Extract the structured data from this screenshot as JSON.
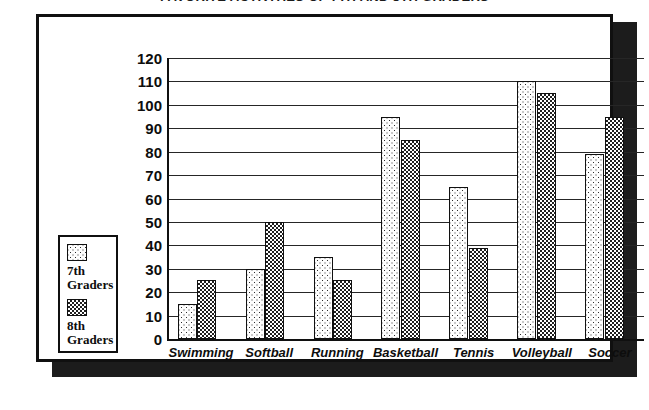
{
  "chart_data": {
    "type": "bar",
    "title": "FAVORITE ACTIVITIES OF 7TH AND 8TH GRADERS",
    "xlabel": "",
    "ylabel": "",
    "ylim": [
      0,
      120
    ],
    "ytick_step": 10,
    "yticks": [
      "120",
      "110",
      "100",
      "90",
      "80",
      "70",
      "60",
      "50",
      "40",
      "30",
      "20",
      "10",
      "0"
    ],
    "grid": true,
    "legend_position": "left-outside",
    "categories": [
      "Swimming",
      "Softball",
      "Running",
      "Basketball",
      "Tennis",
      "Volleyball",
      "Soccer"
    ],
    "series": [
      {
        "name": "7th Graders",
        "legend_label_line1": "7th",
        "legend_label_line2": "Graders",
        "pattern": "sparse-dots",
        "values": [
          15,
          30,
          35,
          95,
          65,
          110,
          79
        ]
      },
      {
        "name": "8th Graders",
        "legend_label_line1": "8th",
        "legend_label_line2": "Graders",
        "pattern": "dense-checker",
        "values": [
          25,
          50,
          25,
          85,
          39,
          105,
          95
        ]
      }
    ]
  },
  "colors": {
    "frame": "#101010",
    "shadow": "#1c1c1c",
    "gridline": "#262626",
    "text": "#0d0d0d",
    "background": "#ffffff"
  }
}
